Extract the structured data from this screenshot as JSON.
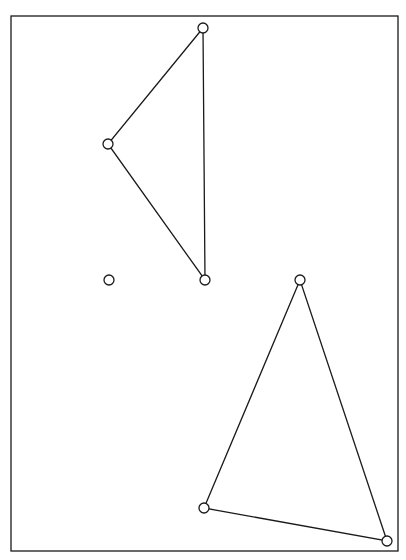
{
  "diagram": {
    "frame": {
      "x": 11,
      "y": 16,
      "width": 387,
      "height": 535
    },
    "stroke_color": "#1a1a1a",
    "background": "#ffffff",
    "triangles": [
      {
        "name": "upper-triangle",
        "vertices": [
          [
            203,
            28
          ],
          [
            108,
            144
          ],
          [
            205,
            280
          ]
        ]
      },
      {
        "name": "lower-triangle",
        "vertices": [
          [
            300,
            280
          ],
          [
            204,
            508
          ],
          [
            387,
            541
          ]
        ]
      }
    ],
    "isolated_points": [
      [
        109,
        280
      ]
    ],
    "vertex_radius": 5
  }
}
